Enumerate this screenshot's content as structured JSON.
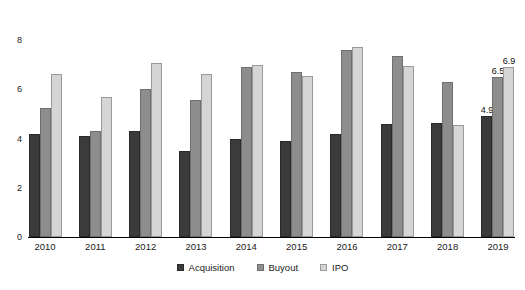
{
  "chart_data": {
    "type": "bar",
    "title": "",
    "subtitle": "",
    "xlabel": "",
    "ylabel": "",
    "ylim": [
      0,
      8
    ],
    "yticks": [
      0,
      2,
      4,
      6,
      8
    ],
    "grid": false,
    "legend_position": "bottom-center",
    "categories": [
      "2010",
      "2011",
      "2012",
      "2013",
      "2014",
      "2015",
      "2016",
      "2017",
      "2018",
      "2019"
    ],
    "series": [
      {
        "name": "Acquisition",
        "color": "#3b3b3b",
        "values": [
          4.2,
          4.1,
          4.3,
          3.5,
          4.0,
          3.9,
          4.2,
          4.6,
          4.65,
          4.9
        ]
      },
      {
        "name": "Buyout",
        "color": "#8d8d8d",
        "values": [
          5.25,
          4.3,
          6.0,
          5.55,
          6.9,
          6.7,
          7.6,
          7.35,
          6.3,
          6.5
        ]
      },
      {
        "name": "IPO",
        "color": "#d5d5d5",
        "values": [
          6.6,
          5.7,
          7.05,
          6.6,
          7.0,
          6.55,
          7.7,
          6.95,
          4.55,
          6.9
        ]
      }
    ],
    "data_labels": {
      "2019": {
        "Acquisition": "4.9",
        "Buyout": "6.5",
        "IPO": "6.9"
      }
    }
  },
  "axis": {
    "y_tick_labels": [
      "8",
      "6",
      "4",
      "2",
      "0"
    ]
  },
  "legend": {
    "items": [
      {
        "label": "Acquisition",
        "key": "acquisition"
      },
      {
        "label": "Buyout",
        "key": "buyout"
      },
      {
        "label": "IPO",
        "key": "ipo"
      }
    ]
  }
}
